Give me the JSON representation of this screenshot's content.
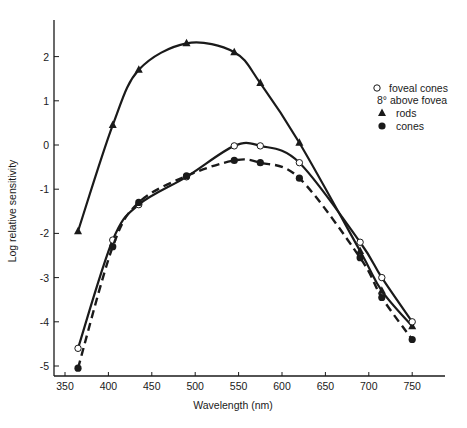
{
  "chart_data": {
    "type": "line",
    "title": "",
    "xlabel": "Wavelength (nm)",
    "ylabel": "Log relative sensitivity",
    "xlim": [
      340,
      790
    ],
    "ylim": [
      -5.2,
      2.8
    ],
    "x_ticks": [
      350,
      400,
      450,
      500,
      550,
      600,
      650,
      700,
      750
    ],
    "y_ticks": [
      2,
      1,
      0,
      -1,
      -2,
      -3,
      -4,
      -5
    ],
    "grid": false,
    "legend_position": "upper right",
    "legend": {
      "header": "",
      "entries": [
        {
          "marker": "open-circle",
          "label": "foveal cones"
        },
        {
          "marker": "none",
          "label": "8° above fovea"
        },
        {
          "marker": "filled-triangle",
          "label": "rods"
        },
        {
          "marker": "filled-circle",
          "label": "cones"
        }
      ]
    },
    "series": [
      {
        "name": "rods (8° above fovea)",
        "marker": "filled-triangle",
        "line": "solid",
        "x": [
          365,
          405,
          435,
          490,
          545,
          575,
          620,
          690,
          715,
          750
        ],
        "y": [
          -1.95,
          0.45,
          1.7,
          2.3,
          2.1,
          1.4,
          0.05,
          -2.4,
          -3.3,
          -4.1
        ]
      },
      {
        "name": "foveal cones",
        "marker": "open-circle",
        "line": "solid",
        "x": [
          365,
          405,
          435,
          490,
          545,
          575,
          620,
          690,
          715,
          750
        ],
        "y": [
          -4.6,
          -2.15,
          -1.35,
          -0.72,
          -0.02,
          -0.02,
          -0.4,
          -2.2,
          -3.0,
          -4.0
        ]
      },
      {
        "name": "cones (8° above fovea)",
        "marker": "filled-circle",
        "line": "dashed",
        "x": [
          365,
          405,
          435,
          490,
          545,
          575,
          620,
          690,
          715,
          750
        ],
        "y": [
          -5.05,
          -2.3,
          -1.3,
          -0.7,
          -0.35,
          -0.4,
          -0.75,
          -2.55,
          -3.45,
          -4.4
        ]
      }
    ]
  },
  "colors": {
    "ink": "#1a1a1a",
    "background": "#ffffff"
  }
}
